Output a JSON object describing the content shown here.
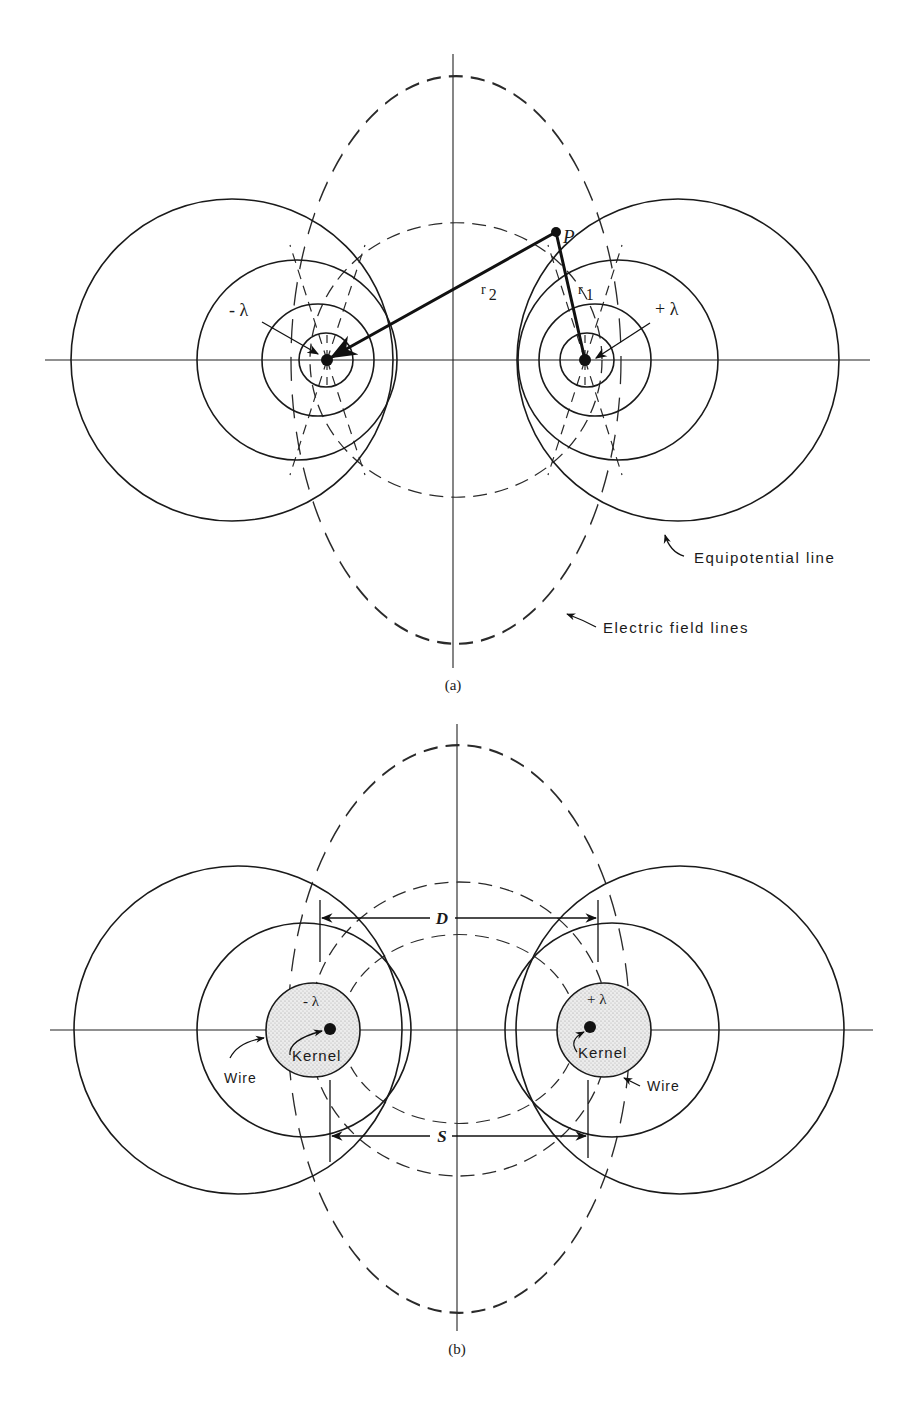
{
  "figure_a": {
    "caption": "(a)",
    "point_label": "P",
    "r1_main": "r",
    "r1_sub": "1",
    "r2_main": "r",
    "r2_sub": "2",
    "neg_charge_label": "- λ",
    "pos_charge_label": "+ λ",
    "equipotential_label": "Equipotential line",
    "field_lines_label": "Electric field lines"
  },
  "figure_b": {
    "caption": "(b)",
    "neg_charge_label": "- λ",
    "pos_charge_label": "+ λ",
    "left_kernel_label": "Kernel",
    "right_kernel_label": "Kernel",
    "left_wire_label": "Wire",
    "right_wire_label": "Wire",
    "d_label": "D",
    "s_label": "S"
  },
  "colors": {
    "ink": "#1a1a1a",
    "wire_fill": "#d9d9d9",
    "background": "#ffffff"
  }
}
